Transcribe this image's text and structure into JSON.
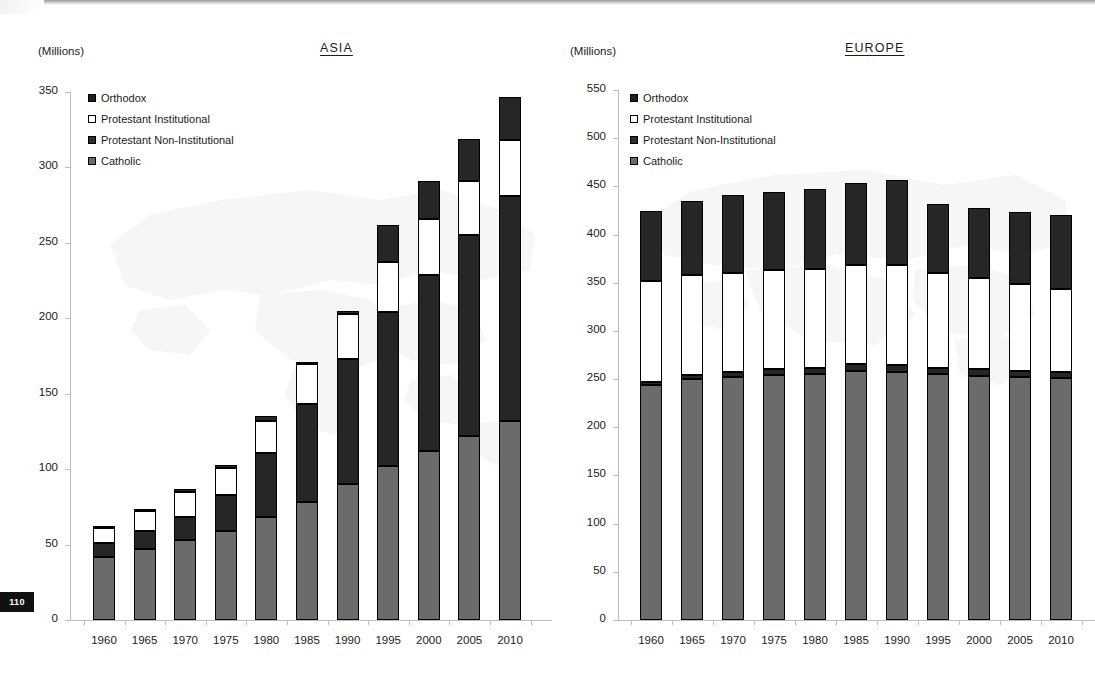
{
  "page": {
    "number": "110"
  },
  "legend": {
    "items": [
      {
        "key": "orthodox",
        "label": "Orthodox",
        "color": "#1f1f1f"
      },
      {
        "key": "protestant_institutional",
        "label": "Protestant Institutional",
        "color": "#ffffff"
      },
      {
        "key": "protestant_non_institutional",
        "label": "Protestant Non-Institutional",
        "color": "#2e2e2e"
      },
      {
        "key": "catholic",
        "label": "Catholic",
        "color": "#6b6b6b"
      }
    ]
  },
  "charts": [
    {
      "id": "asia",
      "title": "ASIA",
      "units": "(Millions)"
    },
    {
      "id": "europe",
      "title": "EUROPE",
      "units": "(Millions)"
    }
  ],
  "chart_data": [
    {
      "type": "bar",
      "subtype": "stacked",
      "id": "asia",
      "title": "ASIA",
      "xlabel": "",
      "ylabel": "(Millions)",
      "ylim": [
        0,
        350
      ],
      "yticks": [
        0,
        50,
        100,
        150,
        200,
        250,
        300,
        350
      ],
      "grid": false,
      "legend_position": "top-left",
      "categories": [
        "1960",
        "1965",
        "1970",
        "1975",
        "1980",
        "1985",
        "1990",
        "1995",
        "2000",
        "2005",
        "2010"
      ],
      "series": [
        {
          "name": "Catholic",
          "color": "#6b6b6b",
          "values": [
            42,
            47,
            53,
            59,
            68,
            78,
            90,
            102,
            112,
            122,
            132
          ]
        },
        {
          "name": "Protestant Non-Institutional",
          "color": "#262626",
          "values": [
            9,
            12,
            15,
            24,
            43,
            65,
            83,
            102,
            117,
            133,
            149
          ]
        },
        {
          "name": "Protestant Institutional",
          "color": "#ffffff",
          "values": [
            10,
            13,
            17,
            18,
            21,
            27,
            30,
            33,
            37,
            36,
            37
          ]
        },
        {
          "name": "Orthodox",
          "color": "#262626",
          "values": [
            1,
            1,
            2,
            2,
            3,
            1,
            2,
            25,
            25,
            28,
            29
          ]
        }
      ],
      "totals": [
        62,
        73,
        87,
        103,
        135,
        171,
        205,
        262,
        291,
        319,
        347
      ]
    },
    {
      "type": "bar",
      "subtype": "stacked",
      "id": "europe",
      "title": "EUROPE",
      "xlabel": "",
      "ylabel": "(Millions)",
      "ylim": [
        0,
        550
      ],
      "yticks": [
        0,
        50,
        100,
        150,
        200,
        250,
        300,
        350,
        400,
        450,
        500,
        550
      ],
      "grid": false,
      "legend_position": "top-left",
      "categories": [
        "1960",
        "1965",
        "1970",
        "1975",
        "1980",
        "1985",
        "1990",
        "1995",
        "2000",
        "2005",
        "2010"
      ],
      "series": [
        {
          "name": "Catholic",
          "color": "#6b6b6b",
          "values": [
            244,
            250,
            252,
            254,
            255,
            258,
            257,
            255,
            253,
            252,
            251
          ]
        },
        {
          "name": "Protestant Non-Institutional",
          "color": "#262626",
          "values": [
            3,
            4,
            5,
            6,
            7,
            8,
            8,
            7,
            7,
            6,
            6
          ]
        },
        {
          "name": "Protestant Institutional",
          "color": "#ffffff",
          "values": [
            105,
            104,
            103,
            103,
            102,
            102,
            103,
            98,
            95,
            91,
            87
          ]
        },
        {
          "name": "Orthodox",
          "color": "#262626",
          "values": [
            72,
            77,
            81,
            81,
            83,
            86,
            89,
            72,
            73,
            74,
            76
          ]
        }
      ],
      "totals": [
        424,
        435,
        441,
        444,
        447,
        454,
        457,
        432,
        428,
        423,
        420
      ]
    }
  ]
}
